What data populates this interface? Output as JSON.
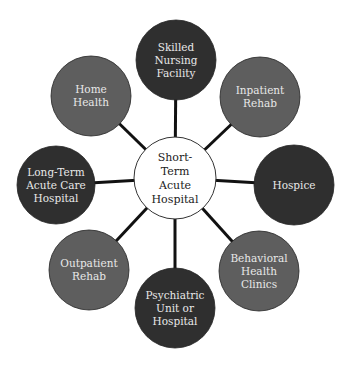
{
  "colors": {
    "dark": "#2f2f2f",
    "medium": "#5e5e5e",
    "hub_fill": "#ffffff",
    "hub_stroke": "#333333",
    "spoke": "#111111"
  },
  "hub": {
    "lines": [
      "Short-",
      "Term",
      "Acute",
      "Hospital"
    ],
    "cx": 175,
    "cy": 178,
    "r": 41
  },
  "nodes": [
    {
      "id": "skilled-nursing-facility",
      "lines": [
        "Skilled",
        "Nursing",
        "Facility"
      ],
      "tone": "dark",
      "cx": 176,
      "cy": 60,
      "r": 40
    },
    {
      "id": "inpatient-rehab",
      "lines": [
        "Inpatient",
        "Rehab"
      ],
      "tone": "medium",
      "cx": 260,
      "cy": 97,
      "r": 40
    },
    {
      "id": "hospice",
      "lines": [
        "Hospice"
      ],
      "tone": "dark",
      "cx": 294,
      "cy": 185,
      "r": 40
    },
    {
      "id": "behavioral-health-clinics",
      "lines": [
        "Behavioral",
        "Health",
        "Clinics"
      ],
      "tone": "medium",
      "cx": 259,
      "cy": 271,
      "r": 40
    },
    {
      "id": "psychiatric-unit-or-hospital",
      "lines": [
        "Psychiatric",
        "Unit or",
        "Hospital"
      ],
      "tone": "dark",
      "cx": 175,
      "cy": 308,
      "r": 40
    },
    {
      "id": "outpatient-rehab",
      "lines": [
        "Outpatient",
        "Rehab"
      ],
      "tone": "medium",
      "cx": 89,
      "cy": 270,
      "r": 40
    },
    {
      "id": "long-term-acute-care-hospital",
      "lines": [
        "Long-Term",
        "Acute Care",
        "Hospital"
      ],
      "tone": "dark",
      "cx": 56,
      "cy": 185,
      "r": 39
    },
    {
      "id": "home-health",
      "lines": [
        "Home",
        "Health"
      ],
      "tone": "medium",
      "cx": 91,
      "cy": 96,
      "r": 40
    }
  ]
}
